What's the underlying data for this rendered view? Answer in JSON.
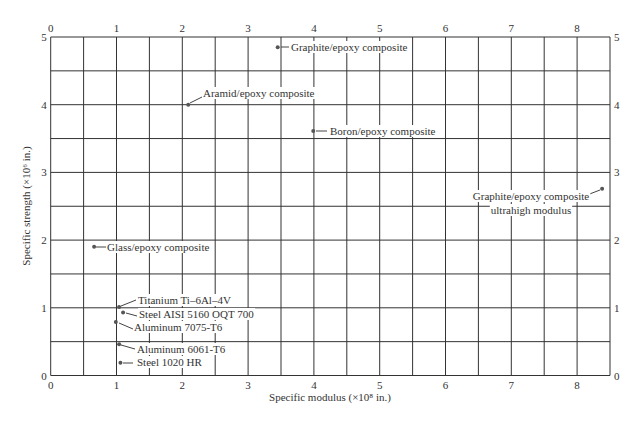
{
  "chart_data": {
    "type": "scatter",
    "title": "",
    "xlabel": "Specific modulus (×10⁸ in.)",
    "ylabel": "Specific strength (×10⁶ in.)",
    "xlim": [
      0,
      8.5
    ],
    "ylim": [
      0,
      5
    ],
    "x_ticks": [
      0,
      1,
      2,
      3,
      4,
      5,
      6,
      7,
      8
    ],
    "y_ticks": [
      0,
      1,
      2,
      3,
      4,
      5
    ],
    "grid": {
      "x_step": 0.5,
      "y_step": 0.5
    },
    "legend": null,
    "points": [
      {
        "label": "Graphite/epoxy composite",
        "x": 3.45,
        "y": 4.85
      },
      {
        "label": "Aramid/epoxy composite",
        "x": 2.09,
        "y": 4.0
      },
      {
        "label": "Boron/epoxy composite",
        "x": 3.99,
        "y": 3.61
      },
      {
        "label": "Graphite/epoxy composite ultrahigh modulus",
        "x": 8.38,
        "y": 2.76
      },
      {
        "label": "Glass/epoxy composite",
        "x": 0.66,
        "y": 1.9
      },
      {
        "label": "Titanium Ti–6Al–4V",
        "x": 1.04,
        "y": 1.01
      },
      {
        "label": "Steel AISI 5160 OQT 700",
        "x": 1.1,
        "y": 0.93
      },
      {
        "label": "Aluminum 7075-T6",
        "x": 0.99,
        "y": 0.79
      },
      {
        "label": "Aluminum 6061-T6",
        "x": 1.04,
        "y": 0.46
      },
      {
        "label": "Steel 1020 HR",
        "x": 1.06,
        "y": 0.19
      }
    ]
  },
  "annotations": [
    {
      "lines": [
        "Graphite/epoxy composite"
      ],
      "tx": 291,
      "ty": 51,
      "anchor": "start",
      "lx1": 281,
      "ly1": 47,
      "lx2": 289,
      "ly2": 47
    },
    {
      "lines": [
        "Aramid/epoxy composite"
      ],
      "tx": 203,
      "ty": 97,
      "anchor": "start",
      "lx1": 190,
      "ly1": 103,
      "lx2": 202,
      "ly2": 97
    },
    {
      "lines": [
        "Boron/epoxy composite"
      ],
      "tx": 330,
      "ty": 135,
      "anchor": "start",
      "lx1": 316,
      "ly1": 131,
      "lx2": 327,
      "ly2": 131
    },
    {
      "lines": [
        "Graphite/epoxy composite",
        "ultrahigh modulus"
      ],
      "tx": 531,
      "ty": 200,
      "anchor": "middle",
      "lx1": 600,
      "ly1": 190,
      "lx2": 587,
      "ly2": 195
    },
    {
      "lines": [
        "Glass/epoxy composite"
      ],
      "tx": 107,
      "ty": 251,
      "anchor": "start",
      "lx1": 96,
      "ly1": 247,
      "lx2": 106,
      "ly2": 247
    },
    {
      "lines": [
        "Titanium Ti–6Al–4V"
      ],
      "tx": 138,
      "ty": 304,
      "anchor": "start",
      "lx1": 121,
      "ly1": 306,
      "lx2": 136,
      "ly2": 300
    },
    {
      "lines": [
        "Steel AISI 5160 OQT 700"
      ],
      "tx": 139,
      "ty": 318,
      "anchor": "start",
      "lx1": 126,
      "ly1": 313,
      "lx2": 137,
      "ly2": 316
    },
    {
      "lines": [
        "Aluminum 7075-T6"
      ],
      "tx": 134,
      "ty": 331,
      "anchor": "start",
      "lx1": 119,
      "ly1": 323,
      "lx2": 133,
      "ly2": 329
    },
    {
      "lines": [
        "Aluminum 6061-T6"
      ],
      "tx": 137,
      "ty": 353,
      "anchor": "start",
      "lx1": 121,
      "ly1": 345,
      "lx2": 135,
      "ly2": 349
    },
    {
      "lines": [
        "Steel 1020 HR"
      ],
      "tx": 137,
      "ty": 366,
      "anchor": "start",
      "lx1": 123,
      "ly1": 363,
      "lx2": 133,
      "ly2": 363
    }
  ],
  "colors": {
    "grid": "#333333",
    "point": "#555555",
    "text": "#333333"
  }
}
